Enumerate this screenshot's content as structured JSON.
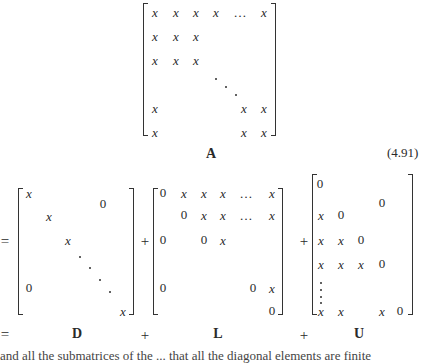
{
  "equation": {
    "number": "(4.91)",
    "matrix_A": {
      "label": "A",
      "rows": [
        [
          "x",
          "x",
          "x",
          "x",
          "…",
          "x"
        ],
        [
          "x",
          "x",
          "x"
        ],
        [
          "x",
          "x",
          "x"
        ],
        [
          "x",
          "x",
          "x"
        ],
        [
          "x",
          "x",
          "x"
        ]
      ]
    },
    "eq_sign": "=",
    "plus_sign": "+",
    "matrix_D": {
      "label": "D",
      "cells": [
        "x",
        "0",
        "x",
        "x",
        "0",
        "x"
      ]
    },
    "matrix_L": {
      "label": "L",
      "row1": [
        "0",
        "x",
        "x",
        "x",
        "…",
        "x"
      ],
      "row2": [
        "0",
        "x",
        "x",
        "…",
        "x"
      ],
      "row3": [
        "0",
        "0",
        "x"
      ],
      "row4": [
        "0",
        "0",
        "x"
      ],
      "row5": [
        "0"
      ]
    },
    "matrix_U": {
      "label": "U",
      "row1": [
        "0"
      ],
      "upper_zero": "0",
      "row2": [
        "x",
        "0"
      ],
      "row3": [
        "x",
        "x",
        "0"
      ],
      "row4": [
        "x",
        "x",
        "x",
        "0"
      ],
      "row5": [
        "x",
        "x",
        "x",
        "0"
      ]
    },
    "bottom_row": {
      "eq": "=",
      "D": "D",
      "plus1": "+",
      "L": "L",
      "plus2": "+",
      "U": "U"
    }
  },
  "footer_text": "and all the submatrices of the  ...  that all the diagonal elements are finite"
}
